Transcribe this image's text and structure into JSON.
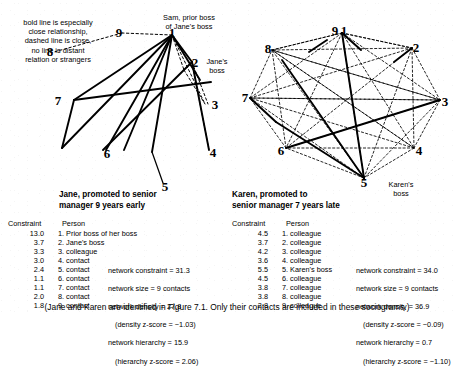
{
  "legend": {
    "note": "bold line is especially\nclose relationship,\ndashed line is close,\nno line is distant\nrelation or strangers"
  },
  "sociogram_left": {
    "name": "Jane sociogram",
    "node_labels": [
      "1",
      "2",
      "3",
      "4",
      "5",
      "6",
      "7",
      "8",
      "9"
    ],
    "annotations": [
      {
        "id": "sam-label",
        "text": "Sam, prior boss\nof Jane's boss"
      },
      {
        "id": "janes-boss-label",
        "text": "Jane's\nboss"
      }
    ]
  },
  "sociogram_right": {
    "name": "Karen sociogram",
    "node_labels": [
      "1",
      "2",
      "3",
      "4",
      "5",
      "6",
      "7",
      "8",
      "9"
    ],
    "annotations": [
      {
        "id": "karens-boss-label",
        "text": "Karen's\nboss"
      }
    ]
  },
  "panel_left": {
    "title": "Jane, promoted to senior\nmanager 9 years early",
    "col_constraint": "Constraint",
    "col_person": "Person",
    "rows": [
      {
        "constraint": "13.0",
        "person": "1. Prior boss of her boss"
      },
      {
        "constraint": "3.7",
        "person": "2. Jane's boss"
      },
      {
        "constraint": "3.3",
        "person": "3. colleague"
      },
      {
        "constraint": "3.0",
        "person": "4. contact"
      },
      {
        "constraint": "2.4",
        "person": "5. contact"
      },
      {
        "constraint": "1.1",
        "person": "6. contact"
      },
      {
        "constraint": "1.1",
        "person": "7. contact"
      },
      {
        "constraint": "2.0",
        "person": "8. contact"
      },
      {
        "constraint": "1.8",
        "person": "9. contact"
      }
    ],
    "stats": [
      "network constraint = 31.3",
      "network size = 9 contacts",
      "network density = 27.8",
      "(density z-score = −1.03)",
      "network hierarchy = 15.9",
      "(hierarchy z-score = 2.06)"
    ]
  },
  "panel_right": {
    "title": "Karen, promoted to\nsenior manager 7 years late",
    "col_constraint": "Constraint",
    "col_person": "Person",
    "rows": [
      {
        "constraint": "4.5",
        "person": "1. colleague"
      },
      {
        "constraint": "3.7",
        "person": "2. colleague"
      },
      {
        "constraint": "4.2",
        "person": "3. colleague"
      },
      {
        "constraint": "3.6",
        "person": "4. colleague"
      },
      {
        "constraint": "5.5",
        "person": "5. Karen's boss"
      },
      {
        "constraint": "4.5",
        "person": "6. colleague"
      },
      {
        "constraint": "3.8",
        "person": "7. colleague"
      },
      {
        "constraint": "3.8",
        "person": "8. colleague"
      },
      {
        "constraint": "2.8",
        "person": "9. colleague"
      }
    ],
    "stats": [
      "network constraint = 34.0",
      "network size = 9 contacts",
      "network density = 36.9",
      "(density z-score = −0.09)",
      "network hierarchy = 0.7",
      "(hierarchy z-score = −1.10)"
    ]
  },
  "caption": "(Jane and Karen are identified in Figure 7.1. Only their contacts are included in these sociograms.)"
}
